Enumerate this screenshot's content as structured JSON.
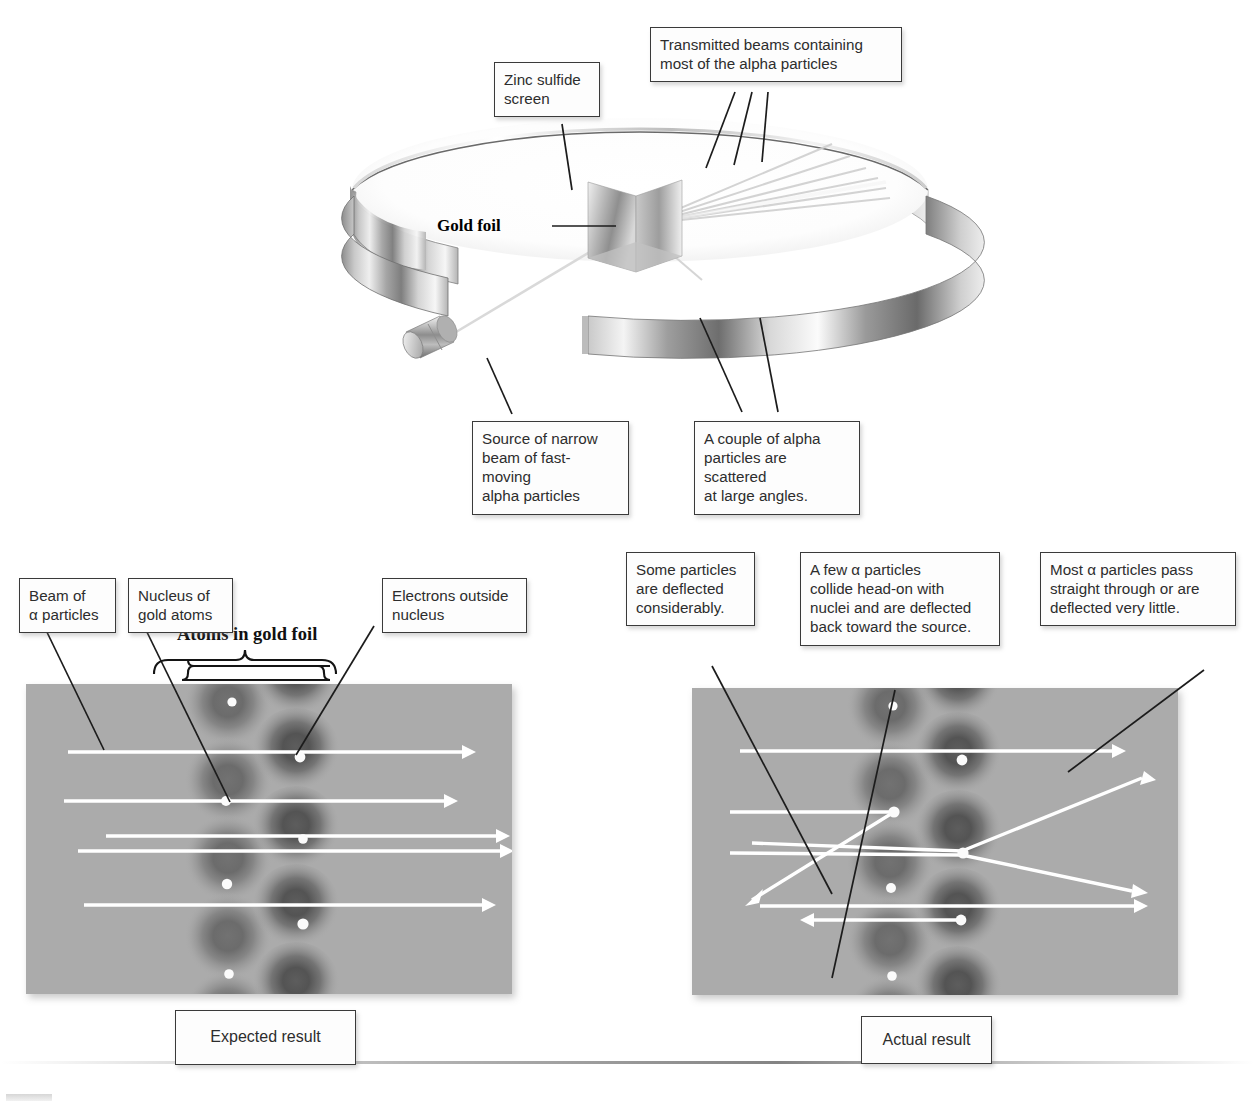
{
  "figure": {
    "kind": "scientific-diagram",
    "background_color": "#ffffff",
    "foil_panel_color": "#ababab",
    "beam_color": "#ffffff",
    "leader_line_color": "#1c1c1c"
  },
  "apparatus": {
    "labels": {
      "zinc_sulfide_screen": "Zinc sulfide\nscreen",
      "transmitted_beams": "Transmitted beams containing\nmost of the alpha particles",
      "gold_foil": "Gold foil",
      "source": "Source of narrow\nbeam of fast-moving\nalpha particles",
      "scattered": "A couple of alpha\nparticles are scattered\nat large angles."
    }
  },
  "expected_panel": {
    "result_label": "Expected result",
    "labels": {
      "beam": "Beam of\nα particles",
      "nucleus": "Nucleus of\ngold atoms",
      "electrons": "Electrons outside\nnucleus"
    },
    "brace_title": "Atoms in gold foil",
    "atom_columns": 2,
    "beam_count": 5,
    "all_beams_straight": true
  },
  "actual_panel": {
    "result_label": "Actual result",
    "labels": {
      "some_deflected": "Some particles\nare deflected\nconsiderably.",
      "head_on": "A few α particles\ncollide head-on with\nnuclei and are deflected\nback toward the source.",
      "most_pass": "Most α particles pass\nstraight through or are\ndeflected very little."
    },
    "atom_columns": 2,
    "beam_count": 5,
    "outcomes": [
      "straight through",
      "deflected considerably downward-left",
      "deflected upward at large angle",
      "deflected downward at moderate angle",
      "back-scattered toward the source"
    ]
  }
}
